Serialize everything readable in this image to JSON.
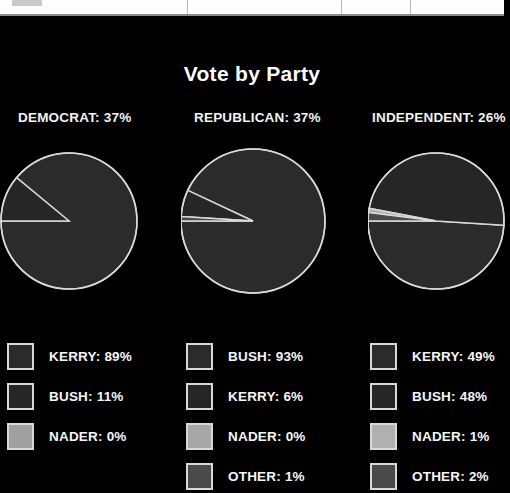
{
  "top_bar": {
    "name": "partial-toolbar",
    "divider_positions": [
      187,
      341,
      410
    ],
    "chip_color": "#c9c9c9",
    "background": "#fdfdfd"
  },
  "header": {
    "title": "Vote by Party"
  },
  "theme": {
    "background": "#000000",
    "text": "#ffffff",
    "pie_stroke": "#d9d9d9"
  },
  "chart_data": {
    "type": "pie",
    "title": "Vote by Party",
    "legend_position": "below-each-pie",
    "charts": [
      {
        "party": "DEMOCRAT",
        "share": 37,
        "header": "DEMOCRAT: 37%",
        "center": [
          70,
          84
        ],
        "radius": 68,
        "categories": [
          "KERRY",
          "BUSH",
          "NADER"
        ],
        "values": [
          89,
          11,
          0
        ],
        "legend": [
          {
            "label": "KERRY: 89%",
            "name": "KERRY",
            "value": 89,
            "color": "#2b2b2b"
          },
          {
            "label": "BUSH: 11%",
            "name": "BUSH",
            "value": 11,
            "color": "#262626"
          },
          {
            "label": "NADER: 0%",
            "name": "NADER",
            "value": 0,
            "color": "#a0a0a0"
          }
        ]
      },
      {
        "party": "REPUBLICAN",
        "share": 37,
        "header": "REPUBLICAN: 37%",
        "center": [
          72,
          84
        ],
        "radius": 72,
        "categories": [
          "BUSH",
          "KERRY",
          "NADER",
          "OTHER"
        ],
        "values": [
          93,
          6,
          0,
          1
        ],
        "legend": [
          {
            "label": "BUSH: 93%",
            "name": "BUSH",
            "value": 93,
            "color": "#2b2b2b"
          },
          {
            "label": "KERRY: 6%",
            "name": "KERRY",
            "value": 6,
            "color": "#262626"
          },
          {
            "label": "NADER: 0%",
            "name": "NADER",
            "value": 0,
            "color": "#a8a8a8"
          },
          {
            "label": "OTHER: 1%",
            "name": "OTHER",
            "value": 1,
            "color": "#4a4a4a"
          }
        ]
      },
      {
        "party": "INDEPENDENT",
        "share": 26,
        "header": "INDEPENDENT: 26%",
        "center": [
          68,
          84
        ],
        "radius": 68,
        "categories": [
          "KERRY",
          "BUSH",
          "NADER",
          "OTHER"
        ],
        "values": [
          49,
          48,
          1,
          2
        ],
        "legend": [
          {
            "label": "KERRY: 49%",
            "name": "KERRY",
            "value": 49,
            "color": "#2b2b2b"
          },
          {
            "label": "BUSH: 48%",
            "name": "BUSH",
            "value": 48,
            "color": "#262626"
          },
          {
            "label": "NADER: 1%",
            "name": "NADER",
            "value": 1,
            "color": "#b0b0b0"
          },
          {
            "label": "OTHER: 2%",
            "name": "OTHER",
            "value": 2,
            "color": "#4a4a4a"
          }
        ]
      }
    ]
  }
}
